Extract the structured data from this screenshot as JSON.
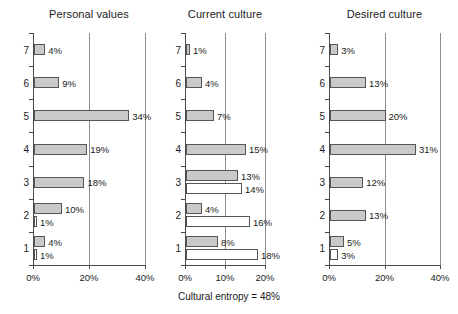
{
  "chart_data": [
    {
      "type": "bar",
      "title": "Personal values",
      "orientation": "horizontal",
      "xlabel": "",
      "ylabel": "",
      "categories": [
        "7",
        "6",
        "5",
        "4",
        "3",
        "2",
        "1"
      ],
      "xlim": [
        0,
        40
      ],
      "xticks": [
        0,
        20,
        40
      ],
      "xticklabels": [
        "0%",
        "20%",
        "40%"
      ],
      "grid": true,
      "gridlines_at": [
        20,
        40
      ],
      "series": [
        {
          "name": "positive",
          "style": "filled-gray",
          "values": [
            4,
            9,
            34,
            19,
            18,
            10,
            4
          ],
          "labels": [
            "4%",
            "9%",
            "34%",
            "19%",
            "18%",
            "10%",
            "4%"
          ]
        },
        {
          "name": "limiting",
          "style": "hollow-white",
          "values": [
            null,
            null,
            null,
            null,
            null,
            1,
            1
          ],
          "labels": [
            null,
            null,
            null,
            null,
            null,
            "1%",
            "1%"
          ]
        }
      ]
    },
    {
      "type": "bar",
      "title": "Current culture",
      "orientation": "horizontal",
      "xlabel": "",
      "ylabel": "",
      "categories": [
        "7",
        "6",
        "5",
        "4",
        "3",
        "2",
        "1"
      ],
      "xlim": [
        0,
        20
      ],
      "xticks": [
        0,
        10,
        20
      ],
      "xticklabels": [
        "0%",
        "10%",
        "20%"
      ],
      "grid": true,
      "gridlines_at": [
        10,
        20
      ],
      "series": [
        {
          "name": "positive",
          "style": "filled-gray",
          "values": [
            1,
            4,
            7,
            15,
            13,
            4,
            8
          ],
          "labels": [
            "1%",
            "4%",
            "7%",
            "15%",
            "13%",
            "4%",
            "8%"
          ]
        },
        {
          "name": "limiting",
          "style": "hollow-white",
          "values": [
            null,
            null,
            null,
            null,
            14,
            16,
            18
          ],
          "labels": [
            null,
            null,
            null,
            null,
            "14%",
            "16%",
            "18%"
          ]
        }
      ]
    },
    {
      "type": "bar",
      "title": "Desired culture",
      "orientation": "horizontal",
      "xlabel": "",
      "ylabel": "",
      "categories": [
        "7",
        "6",
        "5",
        "4",
        "3",
        "2",
        "1"
      ],
      "xlim": [
        0,
        40
      ],
      "xticks": [
        0,
        20,
        40
      ],
      "xticklabels": [
        "0%",
        "20%",
        "40%"
      ],
      "grid": true,
      "gridlines_at": [
        20,
        40
      ],
      "series": [
        {
          "name": "positive",
          "style": "filled-gray",
          "values": [
            3,
            13,
            20,
            31,
            12,
            13,
            5
          ],
          "labels": [
            "3%",
            "13%",
            "20%",
            "31%",
            "12%",
            "13%",
            "5%"
          ]
        },
        {
          "name": "limiting",
          "style": "hollow-white",
          "values": [
            null,
            null,
            null,
            null,
            null,
            null,
            3
          ],
          "labels": [
            null,
            null,
            null,
            null,
            null,
            null,
            "3%"
          ]
        }
      ]
    }
  ],
  "caption": {
    "text": "Cultural entropy = 48%"
  },
  "layout": {
    "panel_origins_x": [
      33,
      185,
      329
    ],
    "panel_plot_widths": [
      112,
      80,
      111
    ],
    "caption_center_x": 229,
    "caption_y": 291
  }
}
